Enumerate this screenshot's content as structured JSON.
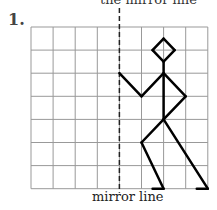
{
  "header": {
    "cut_text": "the mirror line"
  },
  "question": {
    "number": "1."
  },
  "grid": {
    "cols": 8,
    "rows": 7,
    "origin_x": 31,
    "origin_y": 27,
    "cell_w": 22.1,
    "cell_h": 23.1,
    "line_color": "#999999"
  },
  "mirror": {
    "label": "mirror line",
    "col": 4
  },
  "figure": {
    "color": "#000000",
    "segments": [
      [
        [
          6,
          0.5
        ],
        [
          6.5,
          1
        ]
      ],
      [
        [
          6.5,
          1
        ],
        [
          6,
          1.5
        ]
      ],
      [
        [
          6,
          1.5
        ],
        [
          5.5,
          1
        ]
      ],
      [
        [
          5.5,
          1
        ],
        [
          6,
          0.5
        ]
      ],
      [
        [
          6,
          1.5
        ],
        [
          6,
          4
        ]
      ],
      [
        [
          6,
          2
        ],
        [
          5,
          3
        ]
      ],
      [
        [
          5,
          3
        ],
        [
          4,
          2
        ]
      ],
      [
        [
          6,
          2
        ],
        [
          7,
          3
        ]
      ],
      [
        [
          7,
          3
        ],
        [
          6,
          4
        ]
      ],
      [
        [
          6,
          4
        ],
        [
          5,
          5
        ]
      ],
      [
        [
          5,
          5
        ],
        [
          6,
          7
        ]
      ],
      [
        [
          6,
          7
        ],
        [
          5.5,
          7
        ]
      ],
      [
        [
          6,
          4
        ],
        [
          8,
          7
        ]
      ],
      [
        [
          8,
          7
        ],
        [
          7.5,
          7
        ]
      ]
    ]
  }
}
